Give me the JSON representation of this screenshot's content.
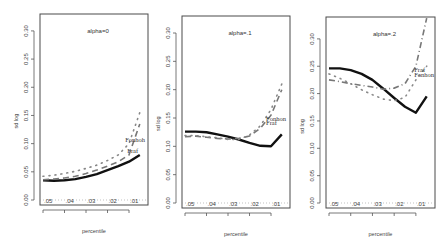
{
  "chart_data": [
    {
      "type": "line",
      "title": "alpha=0",
      "xlabel": "percentile",
      "ylabel": "sd log",
      "x_tick_labels": [
        ".05",
        ".04",
        ".03",
        ".02",
        ".01"
      ],
      "x": [
        0.05,
        0.045,
        0.04,
        0.035,
        0.03,
        0.025,
        0.02,
        0.015,
        0.01,
        0.005
      ],
      "xlim": [
        0.05,
        0.0035
      ],
      "y_tick_labels": [
        "0.00",
        "0.05",
        "0.10",
        "0.15",
        "0.20",
        "0.25",
        "0.30"
      ],
      "ylim": [
        0.0,
        0.33
      ],
      "zero_reference_line": true,
      "series": [
        {
          "name": "solid",
          "style": "solid",
          "values": [
            0.035,
            0.034,
            0.035,
            0.037,
            0.041,
            0.046,
            0.053,
            0.06,
            0.068,
            0.08
          ]
        },
        {
          "name": "Fraf",
          "style": "dashed",
          "values": [
            0.036,
            0.037,
            0.039,
            0.042,
            0.047,
            0.053,
            0.06,
            0.068,
            0.08,
            0.135
          ]
        },
        {
          "name": "Fonhoh",
          "style": "dotted",
          "values": [
            0.042,
            0.044,
            0.047,
            0.051,
            0.056,
            0.062,
            0.07,
            0.08,
            0.1,
            0.155
          ]
        }
      ],
      "annotations": [
        {
          "text": "Fonhoh",
          "at": [
            0.009,
            0.103
          ]
        },
        {
          "text": "Fraf",
          "at": [
            0.008,
            0.084
          ]
        }
      ]
    },
    {
      "type": "line",
      "title": "alpha=.1",
      "xlabel": "percentile",
      "ylabel": "sd log",
      "x_tick_labels": [
        ".05",
        ".04",
        ".03",
        ".02",
        ".01"
      ],
      "x": [
        0.05,
        0.045,
        0.04,
        0.035,
        0.03,
        0.025,
        0.02,
        0.015,
        0.01,
        0.005
      ],
      "xlim": [
        0.05,
        0.0035
      ],
      "y_tick_labels": [
        "0.00",
        "0.05",
        "0.10",
        "0.15",
        "0.20",
        "0.25",
        "0.30"
      ],
      "ylim": [
        0.0,
        0.33
      ],
      "zero_reference_line": true,
      "series": [
        {
          "name": "solid",
          "style": "solid",
          "values": [
            0.126,
            0.126,
            0.125,
            0.121,
            0.117,
            0.112,
            0.106,
            0.101,
            0.1,
            0.121
          ]
        },
        {
          "name": "Fraf",
          "style": "dashed",
          "values": [
            0.117,
            0.118,
            0.116,
            0.114,
            0.113,
            0.114,
            0.118,
            0.132,
            0.155,
            0.2
          ]
        },
        {
          "name": "Fonhon",
          "style": "dotted",
          "values": [
            0.119,
            0.119,
            0.117,
            0.115,
            0.112,
            0.112,
            0.12,
            0.136,
            0.165,
            0.21
          ]
        }
      ],
      "annotations": [
        {
          "text": "Fonhon",
          "at": [
            0.0095,
            0.145
          ]
        },
        {
          "text": "Fraf",
          "at": [
            0.0095,
            0.137
          ]
        }
      ]
    },
    {
      "type": "line",
      "title": "alpha=.2",
      "xlabel": "percentile",
      "ylabel": "sd log",
      "x_tick_labels": [
        ".05",
        ".04",
        ".03",
        ".02",
        ".01"
      ],
      "x": [
        0.05,
        0.045,
        0.04,
        0.035,
        0.03,
        0.025,
        0.02,
        0.015,
        0.01,
        0.005
      ],
      "xlim": [
        0.05,
        0.0035
      ],
      "y_tick_labels": [
        "0.00",
        "0.05",
        "0.10",
        "0.15",
        "0.20",
        "0.25",
        "0.30"
      ],
      "ylim": [
        0.0,
        0.34
      ],
      "zero_reference_line": true,
      "series": [
        {
          "name": "solid",
          "style": "solid",
          "values": [
            0.246,
            0.246,
            0.243,
            0.236,
            0.225,
            0.209,
            0.192,
            0.176,
            0.165,
            0.195
          ]
        },
        {
          "name": "Fraf",
          "style": "dashdot",
          "values": [
            0.225,
            0.222,
            0.218,
            0.215,
            0.212,
            0.208,
            0.21,
            0.218,
            0.25,
            0.338
          ]
        },
        {
          "name": "Fonhon",
          "style": "dotted",
          "values": [
            0.236,
            0.228,
            0.218,
            0.207,
            0.198,
            0.19,
            0.187,
            0.193,
            0.225,
            0.25
          ]
        }
      ],
      "annotations": [
        {
          "text": "Fraf",
          "at": [
            0.008,
            0.24
          ]
        },
        {
          "text": "Fonhon",
          "at": [
            0.008,
            0.23
          ]
        }
      ]
    }
  ]
}
